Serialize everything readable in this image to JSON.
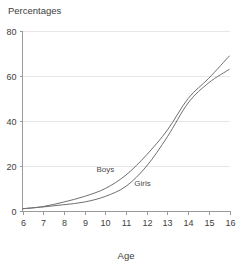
{
  "chart_data": {
    "type": "line",
    "title": "Percentages",
    "xlabel": "Age",
    "ylabel": "",
    "x": [
      6,
      7,
      8,
      9,
      10,
      11,
      12,
      13,
      14,
      15,
      16
    ],
    "series": [
      {
        "name": "Boys",
        "values": [
          1,
          2,
          4,
          6.5,
          10,
          16,
          25,
          36,
          50,
          59,
          69
        ]
      },
      {
        "name": "Girls",
        "values": [
          1,
          1.8,
          2.8,
          4,
          6.5,
          11,
          20,
          33,
          48,
          57,
          63
        ]
      }
    ],
    "xlim": [
      6,
      16
    ],
    "ylim": [
      0,
      80
    ],
    "xticks": [
      "6",
      "7",
      "8",
      "9",
      "10",
      "11",
      "12",
      "13",
      "14",
      "15",
      "16"
    ],
    "yticks": [
      "0",
      "20",
      "40",
      "60",
      "80"
    ],
    "ytick_values": [
      0,
      20,
      40,
      60,
      80
    ],
    "grid": true,
    "legend_position": "inline-annotations",
    "annotations": [
      {
        "text": "Boys",
        "x": 10.0,
        "y": 17.5
      },
      {
        "text": "Girls",
        "x": 11.8,
        "y": 11.0
      }
    ],
    "colors": {
      "line": "#6f6f6f",
      "grid": "#e6e6e6",
      "axis": "#9a9a9a",
      "text": "#3d3d3d",
      "background": "#ffffff"
    }
  }
}
